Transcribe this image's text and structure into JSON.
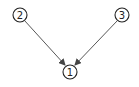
{
  "diagram": {
    "type": "directed-graph",
    "nodes": [
      {
        "id": "1",
        "label": "1",
        "cx": 70,
        "cy": 72,
        "r": 7
      },
      {
        "id": "2",
        "label": "2",
        "cx": 20,
        "cy": 15,
        "r": 7
      },
      {
        "id": "3",
        "label": "3",
        "cx": 122,
        "cy": 15,
        "r": 7
      }
    ],
    "edges": [
      {
        "from": "2",
        "to": "1"
      },
      {
        "from": "3",
        "to": "1"
      }
    ],
    "colors": {
      "stroke": "#222222",
      "edge": "#444444",
      "background": "#ffffff"
    }
  }
}
